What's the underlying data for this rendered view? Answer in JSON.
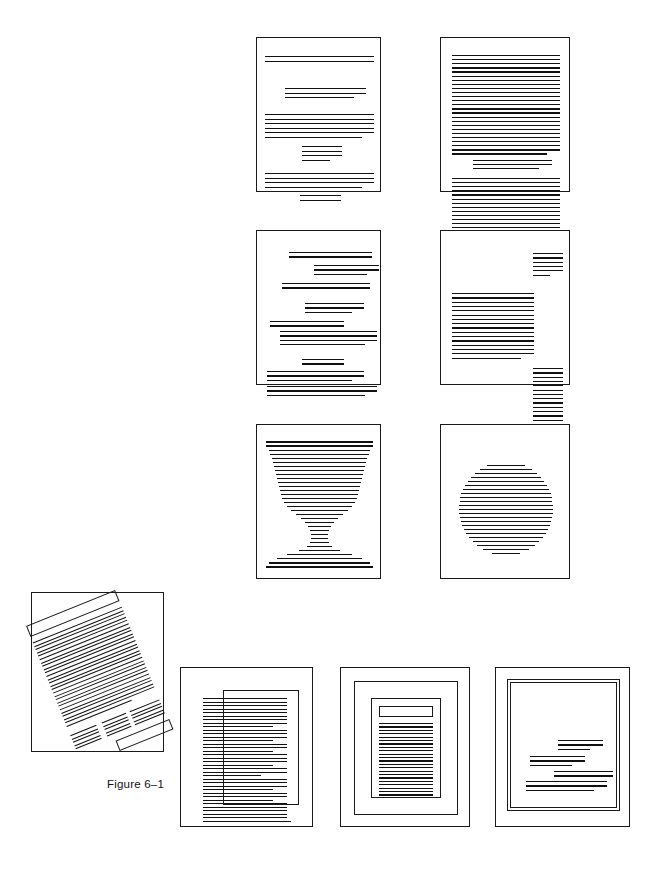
{
  "figure": {
    "caption": "Figure 6– 1",
    "caption_text": "Figure 6–1",
    "title_semantic": "page-layout-variations-figure",
    "canvas": {
      "width": 661,
      "height": 876
    },
    "colors": {
      "background": "#ffffff",
      "rule": "#111111",
      "page_border": "#1a1a1a",
      "caption_text": "#111111"
    }
  },
  "caption": {
    "label": "Figure 6–1",
    "x": 107,
    "y": 778
  },
  "layout": {
    "columns_note": "3 rows of 2 pages (upper grid) plus a bottom row of 1 rotated page and 3 framed pages",
    "rows": 4
  },
  "pages": [
    {
      "id": "page-1",
      "name": "layout-sparse-grouped-paragraphs",
      "row": 1,
      "col": 1,
      "x": 256,
      "y": 37,
      "width": 125,
      "height": 155,
      "description": "Widely spaced paragraph groups with generous white space",
      "line_groups": [
        {
          "lines": 2,
          "left": 8,
          "right": 8,
          "top": 18,
          "spacing": 4.5,
          "thickness": 1.2
        },
        {
          "lines": 3,
          "left": 28,
          "right": 16,
          "top": 50,
          "spacing": 4.5,
          "thickness": 1.2
        },
        {
          "lines": 6,
          "left": 8,
          "right": 8,
          "top": 76,
          "spacing": 4.5,
          "thickness": 1.2
        },
        {
          "lines": 4,
          "left": 45,
          "right": 40,
          "top": 108,
          "spacing": 4.5,
          "thickness": 1.2
        },
        {
          "lines": 4,
          "left": 8,
          "right": 8,
          "top": 135,
          "spacing": 4.5,
          "thickness": 1.2
        },
        {
          "lines": 2,
          "left": 43,
          "right": 41,
          "top": 157,
          "spacing": 4.5,
          "thickness": 1.2
        }
      ]
    },
    {
      "id": "page-2",
      "name": "layout-dense-full-measure",
      "row": 1,
      "col": 2,
      "x": 440,
      "y": 37,
      "width": 130,
      "height": 155,
      "description": "Dense full-measure text block with a short centered break",
      "line_groups": [
        {
          "lines": 25,
          "left": 11,
          "right": 11,
          "top": 17,
          "spacing": 4.1,
          "thickness": 1.3
        },
        {
          "lines": 3,
          "left": 32,
          "right": 19,
          "top": 122,
          "spacing": 4.1,
          "thickness": 1.3
        },
        {
          "lines": 14,
          "left": 11,
          "right": 11,
          "top": 140,
          "spacing": 4.1,
          "thickness": 1.3
        }
      ]
    },
    {
      "id": "page-3",
      "name": "layout-staggered-indents",
      "row": 2,
      "col": 1,
      "x": 256,
      "y": 230,
      "width": 125,
      "height": 155,
      "description": "Staggered and asymmetric indented line groups",
      "line_groups": [
        {
          "lines": 2,
          "left": 32,
          "right": 10,
          "top": 21,
          "spacing": 4.4,
          "thickness": 1.2
        },
        {
          "lines": 3,
          "left": 57,
          "right": 3,
          "top": 34,
          "spacing": 4.4,
          "thickness": 1.2
        },
        {
          "lines": 2,
          "left": 25,
          "right": 12,
          "top": 52,
          "spacing": 4.4,
          "thickness": 1.2
        },
        {
          "lines": 3,
          "left": 48,
          "right": 18,
          "top": 72,
          "spacing": 4.4,
          "thickness": 1.2
        },
        {
          "lines": 2,
          "left": 13,
          "right": 38,
          "top": 90,
          "spacing": 4.4,
          "thickness": 1.2
        },
        {
          "lines": 4,
          "left": 23,
          "right": 5,
          "top": 100,
          "spacing": 4.4,
          "thickness": 1.2
        },
        {
          "lines": 2,
          "left": 45,
          "right": 38,
          "top": 128,
          "spacing": 4.4,
          "thickness": 1.2
        },
        {
          "lines": 3,
          "left": 10,
          "right": 18,
          "top": 140,
          "spacing": 4.4,
          "thickness": 1.2
        },
        {
          "lines": 3,
          "left": 10,
          "right": 5,
          "top": 155,
          "spacing": 4.4,
          "thickness": 1.2
        }
      ]
    },
    {
      "id": "page-4",
      "name": "layout-marginal-sidenotes",
      "row": 2,
      "col": 2,
      "x": 440,
      "y": 230,
      "width": 130,
      "height": 155,
      "description": "Main text column at left with two narrow marginal note blocks at right",
      "line_groups": [
        {
          "lines": 6,
          "left": 92,
          "right": 8,
          "top": 22,
          "spacing": 4.3,
          "thickness": 1.3
        },
        {
          "lines": 16,
          "left": 11,
          "right": 37,
          "top": 62,
          "spacing": 4.3,
          "thickness": 1.3
        },
        {
          "lines": 14,
          "left": 92,
          "right": 8,
          "top": 137,
          "spacing": 4.3,
          "thickness": 1.3
        }
      ]
    },
    {
      "id": "page-5",
      "name": "layout-goblet-silhouette",
      "row": 3,
      "col": 1,
      "x": 256,
      "y": 424,
      "width": 125,
      "height": 155,
      "description": "Lines of varying measure forming a goblet or chalice silhouette",
      "shape": "goblet",
      "shape_profile": [
        {
          "top": 16,
          "inset": 9,
          "thickness": 1.6
        },
        {
          "top": 20,
          "inset": 9,
          "thickness": 1.6
        },
        {
          "top": 25,
          "inset": 12,
          "thickness": 1.3
        },
        {
          "top": 29,
          "inset": 13,
          "thickness": 1.3
        },
        {
          "top": 33,
          "inset": 15,
          "thickness": 1.3
        },
        {
          "top": 37,
          "inset": 16,
          "thickness": 1.3
        },
        {
          "top": 41,
          "inset": 17,
          "thickness": 1.3
        },
        {
          "top": 45,
          "inset": 18,
          "thickness": 1.3
        },
        {
          "top": 49,
          "inset": 19,
          "thickness": 1.3
        },
        {
          "top": 53,
          "inset": 20,
          "thickness": 1.3
        },
        {
          "top": 57,
          "inset": 21,
          "thickness": 1.3
        },
        {
          "top": 61,
          "inset": 22,
          "thickness": 1.3
        },
        {
          "top": 65,
          "inset": 23,
          "thickness": 1.3
        },
        {
          "top": 69,
          "inset": 24,
          "thickness": 1.3
        },
        {
          "top": 73,
          "inset": 25,
          "thickness": 1.3
        },
        {
          "top": 77,
          "inset": 27,
          "thickness": 1.3
        },
        {
          "top": 81,
          "inset": 30,
          "thickness": 1.3
        },
        {
          "top": 85,
          "inset": 34,
          "thickness": 1.3
        },
        {
          "top": 89,
          "inset": 39,
          "thickness": 1.3
        },
        {
          "top": 93,
          "inset": 44,
          "thickness": 1.3
        },
        {
          "top": 97,
          "inset": 48,
          "thickness": 1.3
        },
        {
          "top": 101,
          "inset": 51,
          "thickness": 1.3
        },
        {
          "top": 105,
          "inset": 53,
          "thickness": 1.3
        },
        {
          "top": 109,
          "inset": 54,
          "thickness": 1.3
        },
        {
          "top": 113,
          "inset": 54,
          "thickness": 1.3
        },
        {
          "top": 117,
          "inset": 53,
          "thickness": 1.3
        },
        {
          "top": 121,
          "inset": 50,
          "thickness": 1.3
        },
        {
          "top": 125,
          "inset": 42,
          "thickness": 1.3
        },
        {
          "top": 129,
          "inset": 30,
          "thickness": 1.3
        },
        {
          "top": 133,
          "inset": 20,
          "thickness": 1.4
        },
        {
          "top": 137,
          "inset": 12,
          "thickness": 1.6
        },
        {
          "top": 141,
          "inset": 9,
          "thickness": 1.6
        }
      ]
    },
    {
      "id": "page-6",
      "name": "layout-circle-silhouette",
      "row": 3,
      "col": 2,
      "x": 440,
      "y": 424,
      "width": 130,
      "height": 155,
      "description": "Lines of varying measure forming a circular silhouette",
      "shape": "circle",
      "circle": {
        "center_x": 65,
        "center_y": 83,
        "radius": 47,
        "line_spacing": 4.0,
        "thickness": 1.4
      }
    },
    {
      "id": "page-7",
      "name": "layout-rotated-tilted-page",
      "row": 4,
      "col": 1,
      "x": 31,
      "y": 592,
      "width": 133,
      "height": 160,
      "description": "Page with a tilted text block, outlined header bar, three short columns and an outlined footer bar",
      "rotation_deg": -22,
      "content": {
        "header_bar": {
          "outlined": true
        },
        "body_lines": 26,
        "columns": 3,
        "footer_bar": {
          "outlined": true
        }
      }
    },
    {
      "id": "page-8",
      "name": "layout-text-with-offset-rule-box",
      "row": 4,
      "col": 2,
      "x": 180,
      "y": 667,
      "width": 133,
      "height": 160,
      "description": "Ragged-right text column overlaid by an offset open rectangular rule",
      "frames": [
        {
          "left": 42,
          "top": 22,
          "width": 76,
          "height": 115,
          "name": "offset-rule-box"
        }
      ],
      "line_count": 36
    },
    {
      "id": "page-9",
      "name": "layout-nested-frames-centered-text",
      "row": 4,
      "col": 3,
      "x": 340,
      "y": 667,
      "width": 130,
      "height": 160,
      "description": "Two nested rectangular frames enclosing a bordered text block with a head box",
      "frames": [
        {
          "left": 13,
          "top": 13,
          "width": 104,
          "height": 134,
          "name": "outer-frame"
        },
        {
          "left": 30,
          "top": 30,
          "width": 70,
          "height": 100,
          "name": "inner-frame"
        }
      ],
      "head_box": {
        "left": 38,
        "top": 38,
        "width": 54,
        "height": 11
      },
      "line_count": 22
    },
    {
      "id": "page-10",
      "name": "layout-double-frame-small-text",
      "row": 4,
      "col": 4,
      "x": 495,
      "y": 667,
      "width": 135,
      "height": 160,
      "description": "Double rule frame with a small staggered block of text low on the page",
      "frames": [
        {
          "left": 11,
          "top": 11,
          "width": 113,
          "height": 132,
          "name": "outer-rule"
        },
        {
          "left": 14,
          "top": 14,
          "width": 107,
          "height": 126,
          "name": "inner-rule"
        }
      ],
      "line_groups": [
        {
          "lines": 3,
          "left": 62,
          "right": 28,
          "top": 72,
          "spacing": 4.4,
          "thickness": 1.2
        },
        {
          "lines": 3,
          "left": 34,
          "right": 46,
          "top": 88,
          "spacing": 4.4,
          "thickness": 1.2
        },
        {
          "lines": 2,
          "left": 58,
          "right": 18,
          "top": 103,
          "spacing": 4.4,
          "thickness": 1.2
        },
        {
          "lines": 3,
          "left": 30,
          "right": 24,
          "top": 113,
          "spacing": 4.4,
          "thickness": 1.2
        }
      ]
    }
  ]
}
